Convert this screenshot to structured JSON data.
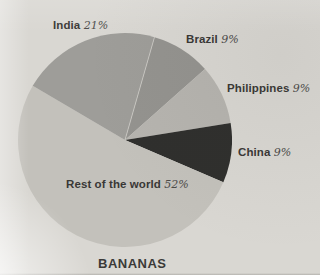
{
  "page": {
    "background_color": "#d9d7d2",
    "appearance": "grayscale printed chart photograph"
  },
  "chart_data": {
    "type": "pie",
    "title": "BANANAS",
    "unit": "%",
    "legend_position": "labels-on-chart",
    "start_angle_deg": 16,
    "center_x": 125,
    "center_y": 140,
    "radius": 107,
    "divider_color": "#d4d2cd",
    "slices": [
      {
        "label": "Brazil",
        "value": 9,
        "pct": "9%",
        "color": "#94938f"
      },
      {
        "label": "Philippines",
        "value": 9,
        "pct": "9%",
        "color": "#b6b4af"
      },
      {
        "label": "China",
        "value": 9,
        "pct": "9%",
        "color": "#2f2f2d"
      },
      {
        "label": "Rest of the world",
        "value": 52,
        "pct": "52%",
        "color": "#c3c1bb"
      },
      {
        "label": "India",
        "value": 21,
        "pct": "21%",
        "color": "#9e9d99"
      }
    ]
  }
}
